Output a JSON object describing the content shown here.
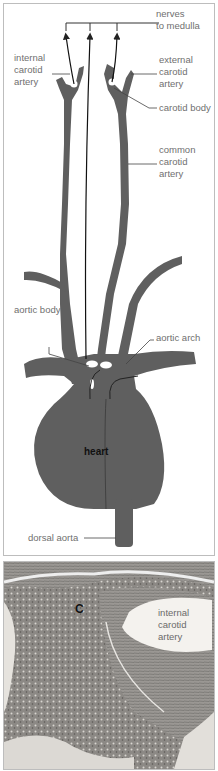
{
  "diagram": {
    "labels": {
      "nerves": "nerves\nto medulla",
      "internal_carotid": "internal\ncarotid\nartery",
      "external_carotid": "external\ncarotid\nartery",
      "carotid_body": "carotid body",
      "common_carotid": "common\ncarotid\nartery",
      "aortic_body": "aortic body",
      "aortic_arch": "aortic arch",
      "heart": "heart",
      "dorsal_aorta": "dorsal aorta"
    },
    "colors": {
      "vessel": "#5f5f5f",
      "line": "#333333",
      "label": "#6f6f6f",
      "border": "#bdbdbd"
    }
  },
  "micrograph": {
    "labels": {
      "c": "C",
      "internal_carotid": "internal\ncarotid\nartery"
    }
  }
}
